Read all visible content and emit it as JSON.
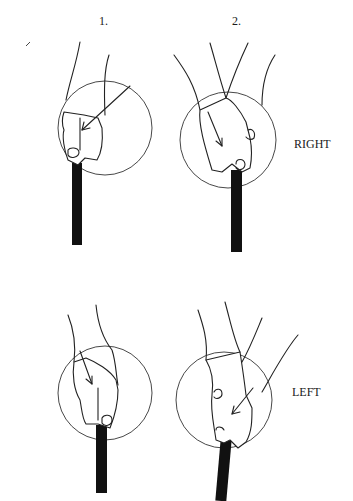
{
  "figure": {
    "columns": [
      {
        "label": "1."
      },
      {
        "label": "2."
      }
    ],
    "rows": [
      {
        "label": "RIGHT"
      },
      {
        "label": "LEFT"
      }
    ],
    "panels": [
      {
        "row": "RIGHT",
        "column": "1.",
        "description": "hand gripping handle, arrow pointing to knuckle"
      },
      {
        "row": "RIGHT",
        "column": "2.",
        "description": "hand rotated gripping handle, arrow pointing down"
      },
      {
        "row": "LEFT",
        "column": "1.",
        "description": "hand gripping handle, arrow pointing down"
      },
      {
        "row": "LEFT",
        "column": "2.",
        "description": "hand rotated gripping handle, arrow pointing to knuckle"
      }
    ]
  }
}
